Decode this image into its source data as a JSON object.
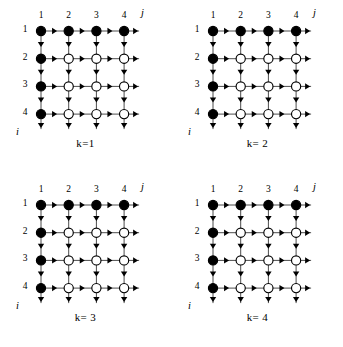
{
  "figure": {
    "width": 343,
    "height": 347,
    "background_color": "#ffffff",
    "ink_color": "#000000",
    "line_color": "#4d4d4d"
  },
  "chart_data": {
    "type": "diagram",
    "title": "",
    "grid": {
      "rows": 4,
      "cols": 4,
      "row_labels": [
        "1",
        "2",
        "3",
        "4"
      ],
      "col_labels": [
        "1",
        "2",
        "3",
        "4"
      ],
      "row_axis_label": "i",
      "col_axis_label": "j",
      "node_states": {
        "filled": "solid black disc",
        "open": "white disc with black outline"
      },
      "filled_nodes": [
        [
          1,
          1
        ],
        [
          1,
          2
        ],
        [
          1,
          3
        ],
        [
          1,
          4
        ],
        [
          2,
          1
        ],
        [
          3,
          1
        ],
        [
          4,
          1
        ]
      ]
    },
    "panels": [
      {
        "id": "panel-k1",
        "caption": "k=1",
        "k": 1,
        "x": 0,
        "y": 0,
        "arrows_right": [
          [
            1,
            1
          ],
          [
            1,
            2
          ],
          [
            1,
            3
          ],
          [
            1,
            4
          ],
          [
            2,
            1
          ],
          [
            2,
            2
          ],
          [
            2,
            3
          ],
          [
            2,
            4
          ],
          [
            3,
            1
          ],
          [
            3,
            2
          ],
          [
            3,
            3
          ],
          [
            3,
            4
          ],
          [
            4,
            1
          ],
          [
            4,
            2
          ],
          [
            4,
            3
          ],
          [
            4,
            4
          ]
        ],
        "arrows_down": [
          [
            1,
            1
          ],
          [
            1,
            2
          ],
          [
            1,
            3
          ],
          [
            1,
            4
          ],
          [
            2,
            1
          ],
          [
            2,
            2
          ],
          [
            2,
            3
          ],
          [
            2,
            4
          ],
          [
            3,
            1
          ],
          [
            3,
            2
          ],
          [
            3,
            3
          ],
          [
            3,
            4
          ],
          [
            4,
            1
          ],
          [
            4,
            2
          ],
          [
            4,
            3
          ],
          [
            4,
            4
          ]
        ]
      },
      {
        "id": "panel-k2",
        "caption": "k= 2",
        "k": 2,
        "x": 172,
        "y": 0,
        "arrows_right": [
          [
            1,
            1
          ],
          [
            1,
            2
          ],
          [
            1,
            3
          ],
          [
            1,
            4
          ],
          [
            2,
            1
          ],
          [
            2,
            2
          ],
          [
            2,
            3
          ],
          [
            2,
            4
          ],
          [
            3,
            1
          ],
          [
            3,
            2
          ],
          [
            3,
            3
          ],
          [
            3,
            4
          ],
          [
            4,
            1
          ],
          [
            4,
            2
          ],
          [
            4,
            3
          ],
          [
            4,
            4
          ]
        ],
        "arrows_down": [
          [
            1,
            1
          ],
          [
            1,
            2
          ],
          [
            1,
            3
          ],
          [
            1,
            4
          ],
          [
            2,
            1
          ],
          [
            2,
            2
          ],
          [
            2,
            3
          ],
          [
            2,
            4
          ],
          [
            3,
            1
          ],
          [
            3,
            2
          ],
          [
            3,
            3
          ],
          [
            3,
            4
          ],
          [
            4,
            1
          ],
          [
            4,
            2
          ],
          [
            4,
            3
          ],
          [
            4,
            4
          ]
        ]
      },
      {
        "id": "panel-k3",
        "caption": "k= 3",
        "k": 3,
        "x": 0,
        "y": 174,
        "arrows_right": [
          [
            1,
            1
          ],
          [
            1,
            2
          ],
          [
            1,
            3
          ],
          [
            1,
            4
          ],
          [
            2,
            1
          ],
          [
            2,
            2
          ],
          [
            2,
            3
          ],
          [
            2,
            4
          ],
          [
            3,
            1
          ],
          [
            3,
            2
          ],
          [
            3,
            3
          ],
          [
            3,
            4
          ],
          [
            4,
            1
          ],
          [
            4,
            2
          ],
          [
            4,
            3
          ],
          [
            4,
            4
          ]
        ],
        "arrows_down": [
          [
            1,
            1
          ],
          [
            1,
            2
          ],
          [
            1,
            3
          ],
          [
            1,
            4
          ],
          [
            2,
            1
          ],
          [
            2,
            2
          ],
          [
            2,
            3
          ],
          [
            2,
            4
          ],
          [
            3,
            1
          ],
          [
            3,
            2
          ],
          [
            3,
            3
          ],
          [
            3,
            4
          ],
          [
            4,
            1
          ],
          [
            4,
            2
          ],
          [
            4,
            3
          ],
          [
            4,
            4
          ]
        ]
      },
      {
        "id": "panel-k4",
        "caption": "k= 4",
        "k": 4,
        "x": 172,
        "y": 174,
        "arrows_right": [
          [
            1,
            1
          ],
          [
            1,
            2
          ],
          [
            1,
            3
          ],
          [
            1,
            4
          ],
          [
            2,
            1
          ],
          [
            2,
            2
          ],
          [
            2,
            3
          ],
          [
            2,
            4
          ],
          [
            3,
            1
          ],
          [
            3,
            2
          ],
          [
            3,
            3
          ],
          [
            3,
            4
          ],
          [
            4,
            1
          ],
          [
            4,
            2
          ],
          [
            4,
            3
          ],
          [
            4,
            4
          ]
        ],
        "arrows_down": [
          [
            1,
            1
          ],
          [
            1,
            2
          ],
          [
            1,
            3
          ],
          [
            1,
            4
          ],
          [
            2,
            1
          ],
          [
            2,
            2
          ],
          [
            2,
            3
          ],
          [
            2,
            4
          ],
          [
            3,
            1
          ],
          [
            3,
            2
          ],
          [
            3,
            3
          ],
          [
            3,
            4
          ],
          [
            4,
            1
          ],
          [
            4,
            2
          ],
          [
            4,
            3
          ],
          [
            4,
            4
          ]
        ]
      }
    ],
    "geometry": {
      "origin_x": 41,
      "origin_y": 31,
      "spacing": 27.7,
      "node_radius": 4.6
    }
  }
}
